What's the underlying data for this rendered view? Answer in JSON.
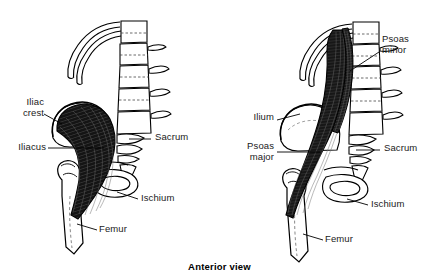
{
  "figure": {
    "caption": "Anterior view",
    "background_color": "#ffffff",
    "ink_color": "#000000",
    "muscle_fill_color": "#1a1a1a",
    "bone_fill_color": "#ffffff"
  },
  "panels": [
    {
      "id": "left",
      "name": "iliacus-panel",
      "muscle_shown": "Iliacus",
      "labels": [
        {
          "id": "iliac-crest",
          "text": "Iliac\ncrest",
          "align": "right",
          "x": 12,
          "y": 97
        },
        {
          "id": "iliacus",
          "text": "Iliacus",
          "align": "right",
          "x": 10,
          "y": 147
        },
        {
          "id": "sacrum",
          "text": "Sacrum",
          "align": "left",
          "x": 156,
          "y": 136
        },
        {
          "id": "ischium",
          "text": "Ischium",
          "align": "left",
          "x": 142,
          "y": 196
        },
        {
          "id": "femur",
          "text": "Femur",
          "align": "left",
          "x": 100,
          "y": 227
        }
      ]
    },
    {
      "id": "right",
      "name": "psoas-panel",
      "muscle_shown": "Psoas major and Psoas minor",
      "labels": [
        {
          "id": "psoas-minor",
          "text": "Psoas\nminor",
          "align": "left",
          "x": 382,
          "y": 38
        },
        {
          "id": "ilium",
          "text": "Ilium",
          "align": "right",
          "x": 247,
          "y": 117
        },
        {
          "id": "psoas-major",
          "text": "Psoas\nmajor",
          "align": "right",
          "x": 241,
          "y": 146
        },
        {
          "id": "sacrum",
          "text": "Sacrum",
          "align": "left",
          "x": 385,
          "y": 147
        },
        {
          "id": "ischium",
          "text": "Ischium",
          "align": "left",
          "x": 372,
          "y": 202
        },
        {
          "id": "femur",
          "text": "Femur",
          "align": "left",
          "x": 326,
          "y": 237
        }
      ]
    }
  ],
  "anatomy_parts": [
    "rib",
    "lumbar-vertebrae",
    "transverse-process",
    "ilium",
    "iliac-crest",
    "sacrum",
    "coccyx",
    "ischium",
    "pubis",
    "femur",
    "greater-trochanter",
    "lesser-trochanter",
    "iliacus-muscle",
    "psoas-major-muscle",
    "psoas-minor-muscle"
  ]
}
